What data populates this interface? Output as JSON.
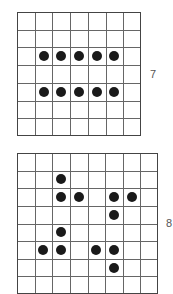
{
  "figures": [
    {
      "label": "7",
      "cols": 7,
      "rows": 7,
      "x": 17,
      "y": 12,
      "width": 124,
      "height": 124,
      "label_x": 150,
      "label_y": 68,
      "dots": [
        [
          1,
          2
        ],
        [
          2,
          2
        ],
        [
          3,
          2
        ],
        [
          4,
          2
        ],
        [
          5,
          2
        ],
        [
          1,
          4
        ],
        [
          2,
          4
        ],
        [
          3,
          4
        ],
        [
          4,
          4
        ],
        [
          5,
          4
        ]
      ]
    },
    {
      "label": "8",
      "cols": 8,
      "rows": 8,
      "x": 17,
      "y": 153,
      "width": 141,
      "height": 141,
      "label_x": 166,
      "label_y": 217,
      "dots": [
        [
          2,
          1
        ],
        [
          2,
          2
        ],
        [
          3,
          2
        ],
        [
          5,
          2
        ],
        [
          6,
          2
        ],
        [
          5,
          3
        ],
        [
          2,
          4
        ],
        [
          1,
          5
        ],
        [
          2,
          5
        ],
        [
          4,
          5
        ],
        [
          5,
          5
        ],
        [
          5,
          6
        ]
      ]
    }
  ],
  "colors": {
    "dot": "#1a1a1a",
    "line": "#666666",
    "border": "#444444"
  }
}
